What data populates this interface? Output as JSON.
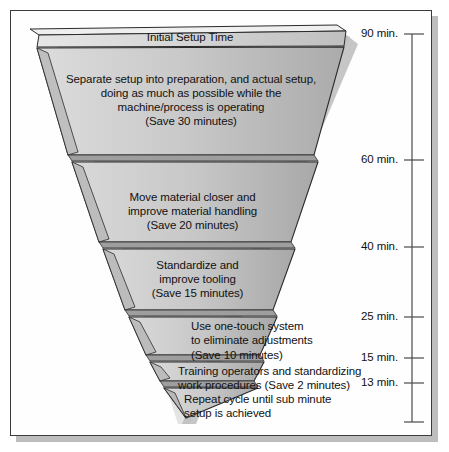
{
  "diagram": {
    "title_band": {
      "label": "Initial Setup Time"
    },
    "segments": [
      {
        "id": "separate-setup",
        "text": "Separate setup into preparation, and actual setup,\ndoing as much as possible while the\nmachine/process is operating\n(Save 30 minutes)",
        "save_minutes": 30,
        "placement": "inside"
      },
      {
        "id": "move-material",
        "text": "Move material closer and\nimprove material handling\n(Save 20 minutes)",
        "save_minutes": 20,
        "placement": "inside"
      },
      {
        "id": "standardize-tooling",
        "text": "Standardize and\nimprove tooling\n(Save 15 minutes)",
        "save_minutes": 15,
        "placement": "inside"
      },
      {
        "id": "one-touch-system",
        "text": "Use one-touch system\nto eliminate adjustments\n(Save 10 minutes)",
        "save_minutes": 10,
        "placement": "right"
      },
      {
        "id": "training-operators",
        "text": "Training operators and standardizing\nwork procedures (Save 2 minutes)",
        "save_minutes": 2,
        "placement": "right"
      },
      {
        "id": "repeat-cycle",
        "text": "Repeat cycle until sub minute\nsetup is achieved",
        "save_minutes": null,
        "placement": "right"
      }
    ],
    "axis": {
      "orientation": "vertical",
      "unit": "min.",
      "ticks": [
        {
          "label": "90 min.",
          "value": 90
        },
        {
          "label": "60 min.",
          "value": 60
        },
        {
          "label": "40 min.",
          "value": 40
        },
        {
          "label": "25 min.",
          "value": 25
        },
        {
          "label": "15 min.",
          "value": 15
        },
        {
          "label": "13 min.",
          "value": 13
        }
      ]
    },
    "colors": {
      "funnel_fill_light": "#d8d8d8",
      "funnel_fill_mid": "#c6c6c6",
      "funnel_fill_dark": "#a9a9a9",
      "outline": "#2b2b2b",
      "shadow": "#bdbdbd",
      "frame_border": "#3b3b3b",
      "text": "#111111"
    }
  }
}
